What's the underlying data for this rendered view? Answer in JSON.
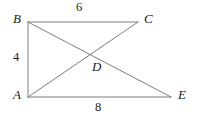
{
  "figure": {
    "type": "geometry-diagram",
    "stroke_color": "#6e6e6e",
    "text_color": "#1a1a1a",
    "background_color": "#ffffff",
    "vertices": [
      {
        "name": "B",
        "label": "B",
        "x": 28,
        "y": 22
      },
      {
        "name": "C",
        "label": "C",
        "x": 138,
        "y": 22
      },
      {
        "name": "A",
        "label": "A",
        "x": 28,
        "y": 97
      },
      {
        "name": "E",
        "label": "E",
        "x": 171,
        "y": 97
      },
      {
        "name": "D",
        "label": "D",
        "x": 93,
        "y": 57
      }
    ],
    "segments": [
      {
        "name": "side-BC",
        "from": "B",
        "to": "C",
        "x1": 28,
        "y1": 22,
        "x2": 138,
        "y2": 22
      },
      {
        "name": "side-AB",
        "from": "A",
        "to": "B",
        "x1": 28,
        "y1": 22,
        "x2": 28,
        "y2": 97
      },
      {
        "name": "side-AE",
        "from": "A",
        "to": "E",
        "x1": 28,
        "y1": 97,
        "x2": 171,
        "y2": 97
      },
      {
        "name": "diagonal-BE",
        "from": "B",
        "to": "E",
        "x1": 28,
        "y1": 22,
        "x2": 171,
        "y2": 97
      },
      {
        "name": "diagonal-AC",
        "from": "A",
        "to": "C",
        "x1": 28,
        "y1": 97,
        "x2": 138,
        "y2": 22
      }
    ],
    "measurements": [
      {
        "name": "length-BC",
        "segment": "BC",
        "value": "6",
        "position": "top"
      },
      {
        "name": "length-AB",
        "segment": "AB",
        "value": "4",
        "position": "left"
      },
      {
        "name": "length-AE",
        "segment": "AE",
        "value": "8",
        "position": "bottom"
      }
    ]
  }
}
